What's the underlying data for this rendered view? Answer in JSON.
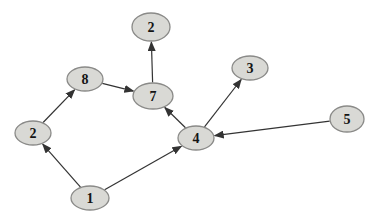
{
  "diagram": {
    "type": "directed-graph",
    "width": 382,
    "height": 224,
    "background": "#ffffff",
    "node_fill": "#d9d9d5",
    "node_stroke": "#8a8a88",
    "edge_color": "#333333",
    "label_color": "#141414",
    "nodes": [
      {
        "id": "n2t",
        "label": "2",
        "cx": 151,
        "cy": 27,
        "rx": 19,
        "ry": 14
      },
      {
        "id": "n8",
        "label": "8",
        "cx": 85,
        "cy": 79,
        "rx": 18,
        "ry": 12
      },
      {
        "id": "n7",
        "label": "7",
        "cx": 153,
        "cy": 96,
        "rx": 20,
        "ry": 13
      },
      {
        "id": "n3",
        "label": "3",
        "cx": 250,
        "cy": 68,
        "rx": 18,
        "ry": 12
      },
      {
        "id": "n2l",
        "label": "2",
        "cx": 33,
        "cy": 133,
        "rx": 18,
        "ry": 12
      },
      {
        "id": "n4",
        "label": "4",
        "cx": 196,
        "cy": 138,
        "rx": 18,
        "ry": 12
      },
      {
        "id": "n5",
        "label": "5",
        "cx": 347,
        "cy": 119,
        "rx": 17,
        "ry": 13
      },
      {
        "id": "n1",
        "label": "1",
        "cx": 90,
        "cy": 198,
        "rx": 19,
        "ry": 12
      }
    ],
    "edges": [
      {
        "from": "n1",
        "to": "n2l"
      },
      {
        "from": "n2l",
        "to": "n8"
      },
      {
        "from": "n8",
        "to": "n7"
      },
      {
        "from": "n7",
        "to": "n2t"
      },
      {
        "from": "n4",
        "to": "n7"
      },
      {
        "from": "n4",
        "to": "n3"
      },
      {
        "from": "n5",
        "to": "n4"
      },
      {
        "from": "n1",
        "to": "n4"
      }
    ]
  }
}
